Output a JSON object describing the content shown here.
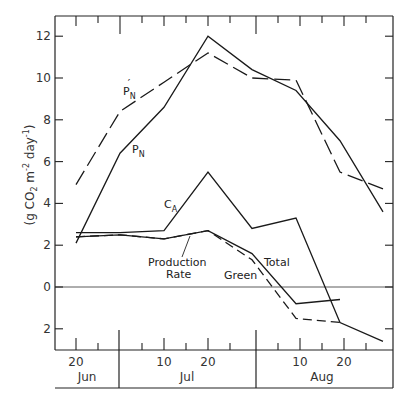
{
  "chart_data": {
    "type": "line",
    "title": "",
    "xlabel": "",
    "ylabel": "(g CO2 m-2 day-1)",
    "ylabel_parts": {
      "prefix": "(g CO",
      "sub": "2",
      "mid": " m",
      "sup1": "-2",
      "mid2": " day",
      "sup2": "-1",
      "suffix": ")"
    },
    "ylim": [
      -3,
      13
    ],
    "yticks": [
      12,
      10,
      8,
      6,
      4,
      2,
      0,
      -2
    ],
    "ytick_labels": [
      "12",
      "10",
      "8",
      "6",
      "4",
      "2",
      "0",
      "2"
    ],
    "x_day_ticks": [
      "20",
      "10",
      "20",
      "10",
      "20"
    ],
    "months": [
      "Jun",
      "Jul",
      "Aug"
    ],
    "x": [
      "Jun 20",
      "Jul 1",
      "Jul 10",
      "Jul 20",
      "Jul 30",
      "Aug 9",
      "Aug 19",
      "Aug 29"
    ],
    "grid": false,
    "zero_line": true,
    "legend": "inline labels",
    "series": [
      {
        "name": "P'N",
        "label": "P",
        "sub": "N",
        "prime": "′",
        "style": "dashed",
        "values": [
          4.9,
          8.4,
          9.8,
          11.2,
          10.0,
          9.9,
          5.5,
          4.7
        ]
      },
      {
        "name": "PN",
        "label": "P",
        "sub": "N",
        "style": "solid",
        "values": [
          2.1,
          6.4,
          8.6,
          12.0,
          10.4,
          9.4,
          7.0,
          3.6
        ]
      },
      {
        "name": "CA",
        "label": "C",
        "sub": "A",
        "style": "solid",
        "values": [
          2.6,
          2.6,
          2.7,
          5.5,
          2.8,
          3.3,
          -1.7,
          -2.6
        ]
      },
      {
        "name": "Production Rate Total",
        "label": "Total",
        "style": "solid",
        "values": [
          2.4,
          2.5,
          2.3,
          2.7,
          1.6,
          -0.8,
          -0.6,
          null
        ]
      },
      {
        "name": "Production Rate Green",
        "label": "Green",
        "style": "dashed",
        "values": [
          2.4,
          2.5,
          2.3,
          2.7,
          1.3,
          -1.5,
          -1.7,
          null
        ]
      }
    ],
    "annotations": [
      "Production",
      "Rate"
    ]
  }
}
